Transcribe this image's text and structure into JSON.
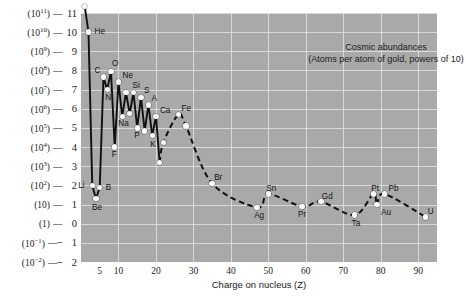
{
  "chart_data": {
    "type": "line",
    "title": "Cosmic abundances",
    "subtitle": "(Atoms per atom of gold, powers of 10)",
    "xlabel": "Charge on nucleus (Z)",
    "ylabel": "",
    "xlim": [
      0,
      95
    ],
    "ylim": [
      -2,
      11
    ],
    "grid": true,
    "legend_position": "none",
    "x_ticks": [
      5,
      10,
      20,
      30,
      40,
      50,
      60,
      70,
      80,
      90
    ],
    "y_ticks": [
      {
        "value": 11,
        "power": "(10",
        "exp": "11",
        "close": ")",
        "num": "11"
      },
      {
        "value": 10,
        "power": "(10",
        "exp": "10",
        "close": ")",
        "num": "10"
      },
      {
        "value": 9,
        "power": "(10",
        "exp": "9",
        "close": ")",
        "num": "9"
      },
      {
        "value": 8,
        "power": "(10",
        "exp": "8",
        "close": ")",
        "num": "8"
      },
      {
        "value": 7,
        "power": "(10",
        "exp": "7",
        "close": ")",
        "num": "7"
      },
      {
        "value": 6,
        "power": "(10",
        "exp": "6",
        "close": ")",
        "num": "6"
      },
      {
        "value": 5,
        "power": "(10",
        "exp": "5",
        "close": ")",
        "num": "5"
      },
      {
        "value": 4,
        "power": "(10",
        "exp": "4",
        "close": ")",
        "num": "4"
      },
      {
        "value": 3,
        "power": "(10",
        "exp": "3",
        "close": ")",
        "num": "3"
      },
      {
        "value": 2,
        "power": "(10",
        "exp": "2",
        "close": ")",
        "num": "2"
      },
      {
        "value": 1,
        "power": "(10",
        "exp": "",
        "close": ")",
        "num": "1"
      },
      {
        "value": 0,
        "power": "(1",
        "exp": "",
        "close": ")",
        "num": "0"
      },
      {
        "value": -1,
        "power": "(10",
        "exp": "-1",
        "close": ")",
        "num": "-1"
      },
      {
        "value": -2,
        "power": "(10",
        "exp": "-2",
        "close": ")",
        "num": "-2"
      }
    ],
    "series": [
      {
        "name": "Cosmic abundance",
        "solid_until_z": 21,
        "points": [
          {
            "z": 1,
            "y": 11.35,
            "label": "H",
            "lx": 2,
            "ly": -13
          },
          {
            "z": 2,
            "y": 10.0,
            "label": "He",
            "lx": 6,
            "ly": -5
          },
          {
            "z": 3,
            "y": 2.0,
            "label": "Li",
            "lx": -14,
            "ly": -4
          },
          {
            "z": 4,
            "y": 1.3,
            "label": "Be",
            "lx": -4,
            "ly": 4
          },
          {
            "z": 5,
            "y": 1.9,
            "label": "B",
            "lx": 6,
            "ly": -4
          },
          {
            "z": 6,
            "y": 7.65,
            "label": "C",
            "lx": -9,
            "ly": -11
          },
          {
            "z": 7,
            "y": 7.0,
            "label": "N",
            "lx": -2,
            "ly": 3
          },
          {
            "z": 8,
            "y": 7.95,
            "label": "O",
            "lx": 1,
            "ly": -12
          },
          {
            "z": 9,
            "y": 4.0,
            "label": "F",
            "lx": -3,
            "ly": 3
          },
          {
            "z": 10,
            "y": 7.4,
            "label": "Ne",
            "lx": 4,
            "ly": -11
          },
          {
            "z": 11,
            "y": 5.6,
            "label": "Na",
            "lx": -4,
            "ly": 3
          },
          {
            "z": 12,
            "y": 6.85,
            "label": "",
            "lx": 0,
            "ly": 0
          },
          {
            "z": 13,
            "y": 5.75,
            "label": "",
            "lx": 0,
            "ly": 0
          },
          {
            "z": 14,
            "y": 6.85,
            "label": "Si",
            "lx": -1,
            "ly": -11
          },
          {
            "z": 15,
            "y": 5.0,
            "label": "P",
            "lx": -3,
            "ly": 3
          },
          {
            "z": 16,
            "y": 6.6,
            "label": "S",
            "lx": 3,
            "ly": -11
          },
          {
            "z": 17,
            "y": 4.85,
            "label": "",
            "lx": 0,
            "ly": 0
          },
          {
            "z": 18,
            "y": 6.2,
            "label": "A",
            "lx": 3,
            "ly": -11
          },
          {
            "z": 19,
            "y": 4.6,
            "label": "K",
            "lx": -2,
            "ly": 4
          },
          {
            "z": 20,
            "y": 5.6,
            "label": "Ca",
            "lx": 4,
            "ly": -10
          },
          {
            "z": 21,
            "y": 3.2,
            "label": "",
            "lx": 0,
            "ly": 0
          },
          {
            "z": 22,
            "y": 4.25,
            "label": "",
            "lx": 0,
            "ly": 0
          },
          {
            "z": 26,
            "y": 5.7,
            "label": "Fe",
            "lx": 3,
            "ly": -11
          },
          {
            "z": 28,
            "y": 5.1,
            "label": "",
            "lx": 0,
            "ly": 0
          },
          {
            "z": 35,
            "y": 2.1,
            "label": "Br",
            "lx": 2,
            "ly": -10
          },
          {
            "z": 47,
            "y": 0.85,
            "label": "Ag",
            "lx": -3,
            "ly": 4
          },
          {
            "z": 50,
            "y": 1.55,
            "label": "Sn",
            "lx": -2,
            "ly": -10
          },
          {
            "z": 59,
            "y": 0.9,
            "label": "Pr",
            "lx": -4,
            "ly": 4
          },
          {
            "z": 64,
            "y": 1.15,
            "label": "Gd",
            "lx": 1,
            "ly": -10
          },
          {
            "z": 73,
            "y": 0.45,
            "label": "Ta",
            "lx": -3,
            "ly": 4
          },
          {
            "z": 78,
            "y": 1.55,
            "label": "Pt",
            "lx": -2,
            "ly": -10
          },
          {
            "z": 79,
            "y": 1.0,
            "label": "Au",
            "lx": 4,
            "ly": 3
          },
          {
            "z": 81,
            "y": 1.55,
            "label": "Pb",
            "lx": 4,
            "ly": -10
          },
          {
            "z": 92,
            "y": 0.35,
            "label": "U",
            "lx": 2,
            "ly": -10
          }
        ]
      }
    ],
    "colors": {
      "plot_background": "#a9a9a9",
      "gridline": "#e2e2e2",
      "curve": "#101010",
      "marker_fill": "#fbfbfb",
      "text": "#141414",
      "page_background": "#ffffff"
    }
  }
}
